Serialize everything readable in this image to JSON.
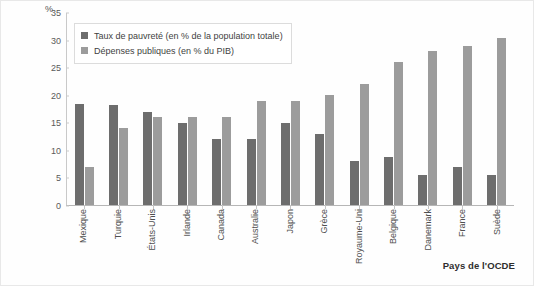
{
  "chart_data": {
    "type": "bar",
    "title": "",
    "xlabel": "Pays de l'OCDE",
    "ylabel": "%",
    "ylim": [
      0,
      35
    ],
    "yticks": [
      0,
      5,
      10,
      15,
      20,
      25,
      30,
      35
    ],
    "grid": false,
    "legend_position": "top-left",
    "categories": [
      "Mexique",
      "Turquie",
      "États-Unis",
      "Irlande",
      "Canada",
      "Australie",
      "Japon",
      "Grèce",
      "Royaume-Uni",
      "Belgique",
      "Danemark",
      "France",
      "Suède"
    ],
    "series": [
      {
        "name": "Taux de pauvreté (en % de la population totale)",
        "color": "#6d6d6d",
        "values": [
          18.5,
          18.3,
          17.0,
          15.0,
          12.0,
          12.0,
          15.0,
          13.0,
          8.0,
          8.7,
          5.5,
          7.0,
          5.5
        ]
      },
      {
        "name": "Dépenses publiques (en % du PIB)",
        "color": "#9c9c9c",
        "values": [
          7.0,
          14.0,
          16.0,
          16.0,
          16.0,
          19.0,
          19.0,
          20.0,
          22.0,
          26.0,
          28.0,
          29.0,
          30.5
        ]
      }
    ]
  },
  "figure": {
    "unit_label": "%",
    "x_caption": "Pays de l'OCDE"
  }
}
